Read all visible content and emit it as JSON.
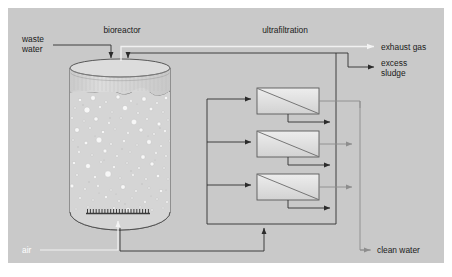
{
  "diagram": {
    "canvas": {
      "width": 452,
      "height": 277,
      "page_background": "#ffffff",
      "plot_background": "#c9c9c9",
      "plot_rect": {
        "x": 8,
        "y": 8,
        "width": 436,
        "height": 255
      }
    },
    "colors": {
      "background": "#c9c9c9",
      "outline": "#3a3a3a",
      "line_dark": "#333333",
      "line_gray": "#8a8a8a",
      "line_white": "#f2f2f2",
      "tank_fill": "#d4d4d4",
      "tank_top_fill": "#d9d9d9",
      "module_fill_light": "#e8e8e8",
      "module_fill_dark": "#c4c4c4",
      "text": "#1a1a1a",
      "text_white": "#ffffff",
      "bubble": "#f6f6f6"
    },
    "section_labels": [
      {
        "name": "bioreactor-label",
        "text": "bioreactor",
        "x": 122,
        "y": 33,
        "anchor": "middle",
        "color": "#1a1a1a"
      },
      {
        "name": "ultrafiltration-label",
        "text": "ultrafiltration",
        "x": 285,
        "y": 33,
        "anchor": "middle",
        "color": "#1a1a1a"
      }
    ],
    "stream_labels": [
      {
        "name": "waste-water-label",
        "lines": [
          "waste",
          "water"
        ],
        "x": 22,
        "y": 45,
        "anchor": "start",
        "color": "#1a1a1a"
      },
      {
        "name": "exhaust-gas-label",
        "lines": [
          "exhaust gas"
        ],
        "x": 381,
        "y": 48,
        "anchor": "start",
        "color": "#1a1a1a"
      },
      {
        "name": "excess-sludge-label",
        "lines": [
          "excess",
          "sludge"
        ],
        "x": 381,
        "y": 68,
        "anchor": "start",
        "color": "#1a1a1a"
      },
      {
        "name": "clean-water-label",
        "lines": [
          "clean water"
        ],
        "x": 377,
        "y": 256,
        "anchor": "start",
        "color": "#1a1a1a"
      },
      {
        "name": "air-label",
        "lines": [
          "air"
        ],
        "x": 22,
        "y": 253,
        "anchor": "start",
        "color": "#ffffff"
      }
    ],
    "bioreactor": {
      "name": "bioreactor-tank",
      "x": 70,
      "y": 60,
      "width": 100,
      "height": 170,
      "liquid_level_y": 90,
      "aerator": {
        "name": "aerator-sparger",
        "x": 86,
        "y": 213,
        "width": 64,
        "teeth": 22
      },
      "bubble_count": 120
    },
    "membrane_modules": [
      {
        "name": "membrane-module-1",
        "x": 257,
        "y": 88,
        "width": 62,
        "height": 26
      },
      {
        "name": "membrane-module-2",
        "x": 257,
        "y": 131,
        "width": 62,
        "height": 26
      },
      {
        "name": "membrane-module-3",
        "x": 257,
        "y": 174,
        "width": 62,
        "height": 26
      }
    ],
    "flow_arrows": [
      {
        "name": "waste-water-inlet-arrow",
        "direction": "down"
      },
      {
        "name": "return-sludge-inlet-arrow",
        "direction": "down"
      },
      {
        "name": "feed-arrow-module-1",
        "direction": "right"
      },
      {
        "name": "feed-arrow-module-2",
        "direction": "right"
      },
      {
        "name": "feed-arrow-module-3",
        "direction": "right"
      },
      {
        "name": "retentate-arrow-module-1",
        "direction": "right"
      },
      {
        "name": "retentate-arrow-module-2",
        "direction": "right"
      },
      {
        "name": "retentate-arrow-module-3",
        "direction": "right"
      },
      {
        "name": "permeate-arrow-module-1",
        "direction": "right"
      },
      {
        "name": "permeate-arrow-module-2",
        "direction": "right"
      },
      {
        "name": "permeate-arrow-module-3",
        "direction": "right"
      },
      {
        "name": "recirculation-pump-arrow",
        "direction": "up"
      },
      {
        "name": "exhaust-gas-arrow",
        "direction": "right"
      },
      {
        "name": "excess-sludge-arrow",
        "direction": "right"
      },
      {
        "name": "clean-water-arrow",
        "direction": "right"
      },
      {
        "name": "air-inlet-arrow",
        "direction": "up"
      }
    ]
  }
}
